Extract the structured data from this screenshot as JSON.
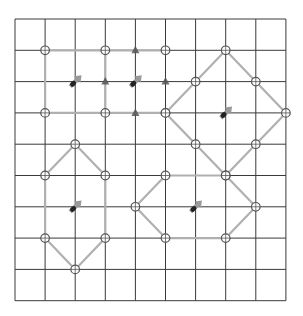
{
  "diagram": {
    "type": "lattice-grid",
    "grid": {
      "cols": 9,
      "rows": 9,
      "origin_x": 15,
      "origin_y": 19,
      "cell_w": 30.1,
      "cell_h": 31.3,
      "line_color": "#3a3a3a"
    },
    "colors": {
      "edge": "#b0b0b0",
      "circle_stroke": "#555555",
      "triangle": "#555555",
      "arrow": "#9a9a9a",
      "arrow_base": "#222222"
    },
    "shapes": [
      {
        "name": "rectangle-top-left",
        "edges": [
          [
            [
              1,
              1
            ],
            [
              5,
              1
            ]
          ],
          [
            [
              1,
              3
            ],
            [
              5,
              3
            ]
          ],
          [
            [
              1,
              1
            ],
            [
              1,
              3
            ]
          ],
          [
            [
              3,
              1
            ],
            [
              3,
              3
            ]
          ]
        ],
        "circles": [
          [
            1,
            1
          ],
          [
            3,
            1
          ],
          [
            5,
            1
          ],
          [
            1,
            3
          ],
          [
            3,
            3
          ],
          [
            5,
            3
          ]
        ],
        "triangles": [
          [
            4,
            1
          ],
          [
            3,
            2
          ],
          [
            5,
            2
          ],
          [
            4,
            3
          ]
        ],
        "arrows": [
          [
            2,
            2
          ],
          [
            4,
            2
          ]
        ]
      },
      {
        "name": "diamond-top-right",
        "edges": [
          [
            [
              7,
              1
            ],
            [
              9,
              3
            ]
          ],
          [
            [
              9,
              3
            ],
            [
              7,
              5
            ]
          ],
          [
            [
              7,
              5
            ],
            [
              5,
              3
            ]
          ],
          [
            [
              5,
              3
            ],
            [
              7,
              1
            ]
          ]
        ],
        "circles": [
          [
            7,
            1
          ],
          [
            6,
            2
          ],
          [
            8,
            2
          ],
          [
            5,
            3
          ],
          [
            9,
            3
          ],
          [
            6,
            4
          ],
          [
            8,
            4
          ],
          [
            7,
            5
          ]
        ],
        "triangles": [],
        "arrows": [
          [
            7,
            3
          ]
        ]
      },
      {
        "name": "hexagon-bottom-left",
        "edges": [
          [
            [
              2,
              4
            ],
            [
              3,
              5
            ]
          ],
          [
            [
              3,
              5
            ],
            [
              3,
              7
            ]
          ],
          [
            [
              3,
              7
            ],
            [
              2,
              8
            ]
          ],
          [
            [
              2,
              8
            ],
            [
              1,
              7
            ]
          ],
          [
            [
              1,
              7
            ],
            [
              1,
              5
            ]
          ],
          [
            [
              1,
              5
            ],
            [
              2,
              4
            ]
          ]
        ],
        "circles": [
          [
            2,
            4
          ],
          [
            1,
            5
          ],
          [
            3,
            5
          ],
          [
            1,
            7
          ],
          [
            3,
            7
          ],
          [
            2,
            8
          ]
        ],
        "triangles": [],
        "arrows": [
          [
            2,
            6
          ]
        ]
      },
      {
        "name": "hexagon-bottom-right",
        "edges": [
          [
            [
              5,
              5
            ],
            [
              7,
              5
            ]
          ],
          [
            [
              7,
              5
            ],
            [
              8,
              6
            ]
          ],
          [
            [
              8,
              6
            ],
            [
              7,
              7
            ]
          ],
          [
            [
              7,
              7
            ],
            [
              5,
              7
            ]
          ],
          [
            [
              5,
              7
            ],
            [
              4,
              6
            ]
          ],
          [
            [
              4,
              6
            ],
            [
              5,
              5
            ]
          ]
        ],
        "circles": [
          [
            5,
            5
          ],
          [
            7,
            5
          ],
          [
            4,
            6
          ],
          [
            8,
            6
          ],
          [
            5,
            7
          ],
          [
            7,
            7
          ]
        ],
        "triangles": [],
        "arrows": [
          [
            6,
            6
          ]
        ]
      }
    ]
  }
}
